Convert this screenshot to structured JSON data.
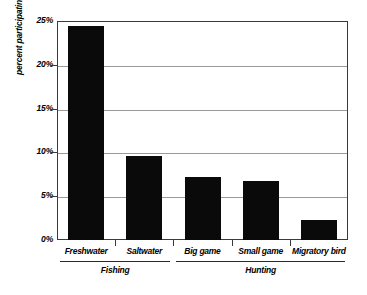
{
  "chart_data": {
    "type": "bar",
    "title": "",
    "xlabel": "",
    "ylabel": "percent participating",
    "categories": [
      "Freshwater",
      "Saltwater",
      "Big game",
      "Small game",
      "Migratory bird"
    ],
    "values": [
      24.4,
      9.6,
      7.2,
      6.7,
      2.3
    ],
    "ylim": [
      0,
      25
    ],
    "yticks": [
      0,
      5,
      10,
      15,
      20,
      25
    ],
    "ytick_labels": [
      "0%",
      "5%",
      "10%",
      "15%",
      "20%",
      "25%"
    ],
    "grid": true,
    "legend": false,
    "bar_color": "#0a0a0a",
    "groups": [
      {
        "label": "Fishing",
        "categories": [
          "Freshwater",
          "Saltwater"
        ]
      },
      {
        "label": "Hunting",
        "categories": [
          "Big game",
          "Small game",
          "Migratory bird"
        ]
      }
    ]
  }
}
